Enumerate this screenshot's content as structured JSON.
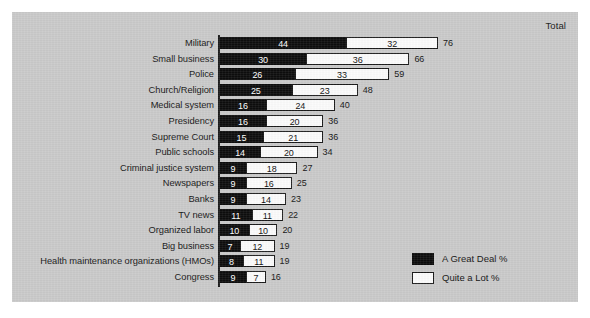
{
  "chart_data": {
    "type": "bar",
    "title": "",
    "subtitle": "",
    "xlabel": "",
    "ylabel": "",
    "orientation": "horizontal",
    "stacked": true,
    "grid": false,
    "xlim": [
      0,
      80
    ],
    "total_header": "Total",
    "legend_position": "bottom-right",
    "categories": [
      "Military",
      "Small business",
      "Police",
      "Church/Religion",
      "Medical system",
      "Presidency",
      "Supreme Court",
      "Public schools",
      "Criminal justice system",
      "Newspapers",
      "Banks",
      "TV news",
      "Organized labor",
      "Big business",
      "Health maintenance organizations (HMOs)",
      "Congress"
    ],
    "series": [
      {
        "name": "A Great Deal %",
        "color": "#0d0d0d",
        "values": [
          44,
          30,
          26,
          25,
          16,
          16,
          15,
          14,
          9,
          9,
          9,
          11,
          10,
          7,
          8,
          9
        ]
      },
      {
        "name": "Quite a Lot %",
        "color": "#fbfbfb",
        "values": [
          32,
          36,
          33,
          23,
          24,
          20,
          21,
          20,
          18,
          16,
          14,
          11,
          10,
          12,
          11,
          7
        ]
      }
    ],
    "totals": [
      76,
      66,
      59,
      48,
      40,
      36,
      36,
      34,
      27,
      25,
      23,
      22,
      20,
      19,
      19,
      16
    ],
    "legend": [
      {
        "label": "A Great Deal %",
        "swatch": "great"
      },
      {
        "label": "Quite a Lot %",
        "swatch": "quite"
      }
    ],
    "colors": {
      "panel_background": "#c9c9c9",
      "page_background": "#ffffff",
      "great_deal": "#0d0d0d",
      "quite_a_lot": "#fbfbfb",
      "outline": "#1a1a1a",
      "text": "#141414"
    }
  }
}
